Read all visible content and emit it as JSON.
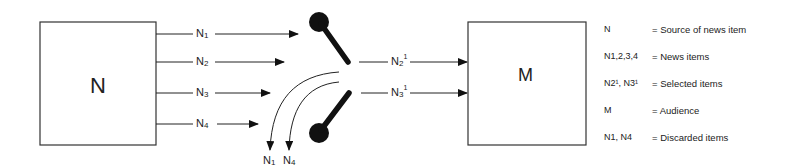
{
  "diagram": {
    "source_box": {
      "label": "N"
    },
    "audience_box": {
      "label": "M"
    },
    "inputs": [
      {
        "base": "N",
        "sub": "1"
      },
      {
        "base": "N",
        "sub": "2"
      },
      {
        "base": "N",
        "sub": "3"
      },
      {
        "base": "N",
        "sub": "4"
      }
    ],
    "outputs": [
      {
        "base": "N",
        "sub": "2",
        "sup": "1"
      },
      {
        "base": "N",
        "sub": "3",
        "sup": "1"
      }
    ],
    "discarded": [
      {
        "base": "N",
        "sub": "1"
      },
      {
        "base": "N",
        "sub": "4"
      }
    ]
  },
  "legend": [
    {
      "key": "N",
      "value": "= Source of news item"
    },
    {
      "key": "N1,2,3,4",
      "value": "= News items"
    },
    {
      "key": "N2¹, N3¹",
      "value": "= Selected items"
    },
    {
      "key": "M",
      "value": "= Audience"
    },
    {
      "key": "N1, N4",
      "value": "= Discarded items"
    }
  ]
}
